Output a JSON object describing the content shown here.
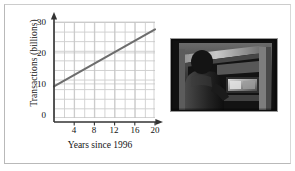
{
  "figure": {
    "caption": "",
    "border_color": "#b9b9b9"
  },
  "chart_data": {
    "type": "line",
    "title": "",
    "xlabel": "Years since 1996",
    "ylabel": "Transactions (billions)",
    "xlim": [
      0,
      21
    ],
    "ylim": [
      0,
      31
    ],
    "xticks": [
      4,
      8,
      12,
      16,
      20
    ],
    "xtick_labels": [
      "4",
      "8",
      "12",
      "16",
      "20"
    ],
    "yticks": [
      0,
      10,
      20,
      30
    ],
    "ytick_labels": [
      "0",
      "10",
      "20",
      "30"
    ],
    "grid": true,
    "grid_color": "#cfcfcf",
    "legend": "none",
    "line_color": "#6d6d6d",
    "series": [
      {
        "name": "ATM transactions",
        "x": [
          0,
          21
        ],
        "values": [
          10.2,
          28.6
        ]
      }
    ]
  },
  "photo": {
    "alt_name": "person-using-atm-photo",
    "description": "Grayscale photograph of a person standing at an ATM machine",
    "frame_color": "#9a9a9a"
  }
}
